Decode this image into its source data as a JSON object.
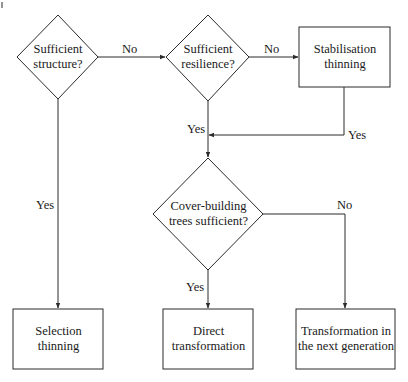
{
  "diagram": {
    "type": "flowchart",
    "nodes": {
      "d1": {
        "kind": "decision",
        "lines": [
          "Sufficient",
          "structure?"
        ]
      },
      "d2": {
        "kind": "decision",
        "lines": [
          "Sufficient",
          "resilience?"
        ]
      },
      "p_stab": {
        "kind": "process",
        "lines": [
          "Stabilisation",
          "thinning"
        ]
      },
      "d3": {
        "kind": "decision",
        "lines": [
          "Cover-building",
          "trees sufficient?"
        ]
      },
      "p_sel": {
        "kind": "process",
        "lines": [
          "Selection",
          "thinning"
        ]
      },
      "p_direct": {
        "kind": "process",
        "lines": [
          "Direct",
          "transformation"
        ]
      },
      "p_next": {
        "kind": "process",
        "lines": [
          "Transformation in",
          "the next generation"
        ]
      }
    },
    "edges": [
      {
        "from": "d1",
        "to": "d2",
        "label": "No"
      },
      {
        "from": "d1",
        "to": "p_sel",
        "label": "Yes"
      },
      {
        "from": "d2",
        "to": "p_stab",
        "label": "No"
      },
      {
        "from": "d2",
        "to": "d3",
        "label": "Yes"
      },
      {
        "from": "p_stab",
        "to": "d3",
        "label": "Yes"
      },
      {
        "from": "d3",
        "to": "p_direct",
        "label": "Yes"
      },
      {
        "from": "d3",
        "to": "p_next",
        "label": "No"
      }
    ]
  },
  "stroke_color": "#2b2b2b"
}
